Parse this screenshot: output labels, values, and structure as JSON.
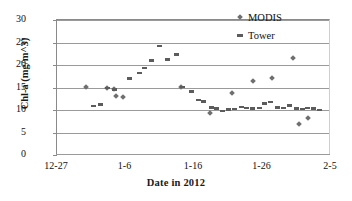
{
  "chart_data": {
    "type": "scatter",
    "title": "",
    "xlabel": "Date in 2012",
    "ylabel": "Chl-a (mg/m^3)",
    "xlim": [
      0,
      40
    ],
    "ylim": [
      0,
      30
    ],
    "ytick_values": [
      0,
      5,
      10,
      15,
      20,
      25,
      30
    ],
    "ytick_labels": [
      "0",
      "5",
      "10",
      "15",
      "20",
      "25",
      "30"
    ],
    "xtick_values": [
      0,
      10,
      20,
      30,
      40
    ],
    "xtick_labels": [
      "12-27",
      "1-6",
      "1-16",
      "1-26",
      "2-5"
    ],
    "xtick_note": "x values are days elapsed from 12-27-2011",
    "grid": "horizontal",
    "legend_position": "top-right",
    "series": [
      {
        "name": "MODIS",
        "marker": "diamond",
        "color": "#6f6f6f",
        "points": [
          [
            4.3,
            15.2
          ],
          [
            7.3,
            14.9
          ],
          [
            8.3,
            14.6
          ],
          [
            8.6,
            13.1
          ],
          [
            9.6,
            13.0
          ],
          [
            18.1,
            15.1
          ],
          [
            22.4,
            9.3
          ],
          [
            25.6,
            13.8
          ],
          [
            28.6,
            16.4
          ],
          [
            31.4,
            17.2
          ],
          [
            34.5,
            21.6
          ],
          [
            35.4,
            6.9
          ],
          [
            36.6,
            8.2
          ]
        ]
      },
      {
        "name": "Tower",
        "marker": "dash",
        "color": "#5c5c5c",
        "points": [
          [
            5.4,
            10.9
          ],
          [
            6.4,
            11.2
          ],
          [
            7.4,
            14.9
          ],
          [
            8.4,
            14.6
          ],
          [
            10.6,
            17.0
          ],
          [
            12.0,
            18.2
          ],
          [
            12.8,
            19.3
          ],
          [
            13.8,
            21.0
          ],
          [
            14.9,
            24.2
          ],
          [
            16.2,
            21.2
          ],
          [
            17.4,
            22.3
          ],
          [
            18.3,
            15.1
          ],
          [
            19.6,
            14.1
          ],
          [
            20.6,
            12.2
          ],
          [
            21.4,
            11.9
          ],
          [
            22.6,
            10.6
          ],
          [
            23.3,
            10.3
          ],
          [
            24.2,
            9.8
          ],
          [
            25.0,
            10.1
          ],
          [
            25.9,
            10.2
          ],
          [
            26.9,
            10.7
          ],
          [
            27.7,
            10.5
          ],
          [
            28.6,
            10.3
          ],
          [
            29.6,
            10.4
          ],
          [
            30.3,
            11.5
          ],
          [
            31.2,
            11.8
          ],
          [
            32.2,
            10.6
          ],
          [
            33.1,
            10.4
          ],
          [
            33.9,
            11.0
          ],
          [
            34.9,
            10.3
          ],
          [
            35.8,
            10.2
          ],
          [
            36.6,
            10.4
          ],
          [
            37.5,
            10.3
          ],
          [
            38.3,
            10.0
          ]
        ]
      }
    ]
  }
}
